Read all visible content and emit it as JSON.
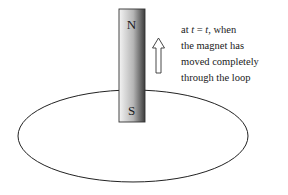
{
  "diagram": {
    "magnet": {
      "north_label": "N",
      "south_label": "S",
      "gradient": [
        "#f2f2f2",
        "#b8b8b8",
        "#3a3a3a"
      ],
      "outline": "#333333"
    },
    "arrow": {
      "direction": "up",
      "style": "hollow"
    },
    "loop": {
      "shape": "ellipse",
      "stroke": "#222222"
    },
    "caption": {
      "line1_pre": "at ",
      "line1_var1": "t",
      "line1_eq": " = ",
      "line1_var2": "t",
      "line1_post": ", when",
      "line2": "the magnet has",
      "line3": "moved completely",
      "line4": "through the loop"
    }
  }
}
